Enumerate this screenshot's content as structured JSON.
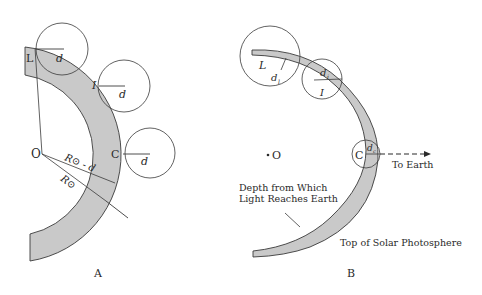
{
  "panel_a": {
    "caption": "A",
    "center_label": "O",
    "points": {
      "L": "L",
      "I": "I",
      "C": "C"
    },
    "depth_label": "d",
    "radius_outer_label": "R⊙",
    "radius_inner_label": "R⊙ - d"
  },
  "panel_b": {
    "caption": "B",
    "center_label": "O",
    "points": {
      "L": "L",
      "I": "I",
      "C": "C"
    },
    "depth_labels": {
      "L": "d",
      "L_sub": "l",
      "I": "d",
      "I_sub": "i",
      "C": "d",
      "C_sub": "c"
    },
    "arrow_label": "To Earth",
    "depth_caption_line1": "Depth from Which",
    "depth_caption_line2": "Light Reaches Earth",
    "surface_caption": "Top of Solar Photosphere"
  },
  "colors": {
    "band_fill": "#c9c9c9",
    "stroke": "#3a3a3a",
    "background": "#ffffff"
  }
}
